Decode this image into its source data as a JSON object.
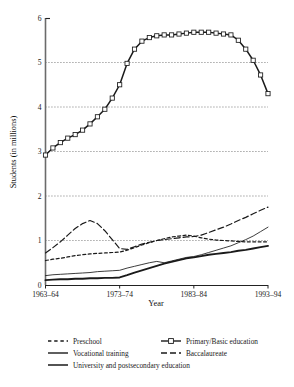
{
  "chart_data": {
    "type": "line",
    "title": "",
    "xlabel": "Year",
    "ylabel": "Students (in millions)",
    "xlim": [
      1963,
      1993
    ],
    "ylim": [
      0,
      6
    ],
    "yticks": [
      0,
      1,
      2,
      3,
      4,
      5,
      6
    ],
    "ytick_labels": [
      "0",
      "1",
      "2",
      "3",
      "4",
      "5",
      "6"
    ],
    "xticks": [
      1963,
      1973,
      1983,
      1993
    ],
    "xtick_labels": [
      "1963–64",
      "1973–74",
      "1983–84",
      "1993–94"
    ],
    "grid": "horizontal-dotted",
    "legend_position": "below-plot",
    "x": [
      1963,
      1964,
      1965,
      1966,
      1967,
      1968,
      1969,
      1970,
      1971,
      1972,
      1973,
      1974,
      1975,
      1976,
      1977,
      1978,
      1979,
      1980,
      1981,
      1982,
      1983,
      1984,
      1985,
      1986,
      1987,
      1988,
      1989,
      1990,
      1991,
      1992,
      1993
    ],
    "series": [
      {
        "name": "Primary/Basic education",
        "style": "solid-with-square-markers",
        "marker": "open-square",
        "values": [
          2.92,
          3.08,
          3.2,
          3.3,
          3.38,
          3.48,
          3.62,
          3.78,
          3.95,
          4.2,
          4.5,
          4.98,
          5.3,
          5.48,
          5.56,
          5.6,
          5.62,
          5.62,
          5.64,
          5.66,
          5.68,
          5.68,
          5.68,
          5.66,
          5.64,
          5.62,
          5.5,
          5.3,
          5.05,
          4.72,
          4.3
        ]
      },
      {
        "name": "Baccalaureate",
        "style": "long-dash",
        "values": [
          0.72,
          0.84,
          0.97,
          1.12,
          1.27,
          1.38,
          1.45,
          1.38,
          1.22,
          1.02,
          0.82,
          0.8,
          0.86,
          0.92,
          0.96,
          1.0,
          1.02,
          1.04,
          1.06,
          1.08,
          1.09,
          1.12,
          1.18,
          1.24,
          1.3,
          1.37,
          1.45,
          1.52,
          1.6,
          1.68,
          1.75
        ]
      },
      {
        "name": "Preschool",
        "style": "short-dash",
        "values": [
          0.55,
          0.58,
          0.6,
          0.63,
          0.66,
          0.68,
          0.7,
          0.71,
          0.72,
          0.73,
          0.74,
          0.78,
          0.84,
          0.9,
          0.95,
          1.0,
          1.04,
          1.08,
          1.1,
          1.12,
          1.1,
          1.06,
          1.03,
          1.01,
          1.0,
          0.99,
          0.98,
          0.97,
          0.97,
          0.97,
          0.97
        ]
      },
      {
        "name": "Vocational training",
        "style": "thin-solid",
        "values": [
          0.21,
          0.23,
          0.24,
          0.25,
          0.26,
          0.27,
          0.28,
          0.3,
          0.31,
          0.32,
          0.33,
          0.38,
          0.42,
          0.46,
          0.5,
          0.53,
          0.5,
          0.54,
          0.58,
          0.62,
          0.64,
          0.68,
          0.73,
          0.78,
          0.83,
          0.88,
          0.95,
          1.02,
          1.1,
          1.2,
          1.3
        ]
      },
      {
        "name": "University and postsecondary education",
        "style": "thick-solid",
        "values": [
          0.11,
          0.12,
          0.13,
          0.13,
          0.14,
          0.14,
          0.15,
          0.15,
          0.16,
          0.16,
          0.17,
          0.22,
          0.28,
          0.33,
          0.38,
          0.43,
          0.48,
          0.52,
          0.56,
          0.6,
          0.62,
          0.65,
          0.68,
          0.7,
          0.72,
          0.74,
          0.77,
          0.79,
          0.82,
          0.85,
          0.88
        ]
      }
    ],
    "legend": [
      {
        "label": "Preschool",
        "swatch": "short-dash"
      },
      {
        "label": "Primary/Basic education",
        "swatch": "line-square-line"
      },
      {
        "label": "Vocational training",
        "swatch": "thin-solid"
      },
      {
        "label": "Baccalaureate",
        "swatch": "long-dash"
      },
      {
        "label": "University and postsecondary education",
        "swatch": "thick-solid"
      }
    ]
  },
  "colors": {
    "ink": "#1a1a1a",
    "axis": "#555555",
    "grid": "#444444",
    "background": "#ffffff"
  }
}
